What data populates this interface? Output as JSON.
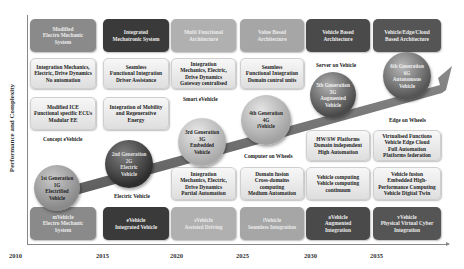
{
  "axes": {
    "y_label": "Performance and Complexity",
    "x_years": [
      "2010",
      "2015",
      "2020",
      "2025",
      "2030",
      "2035"
    ]
  },
  "architecture_boxes": [
    {
      "text": "Modified\nElectro Mechanic\nSystem",
      "color": "#8a8a8a"
    },
    {
      "text": "Integrated\nMechatronic System",
      "color": "#3a3a3a"
    },
    {
      "text": "Multi Functional\nArchitecture",
      "color": "#b0b0b0"
    },
    {
      "text": "Value Based\nArchitecture",
      "color": "#a6a6a6"
    },
    {
      "text": "Vehicle Based\nArchitecture",
      "color": "#4a4a4a"
    },
    {
      "text": "Vehicle/Edge/Cloud\nBased Architecture",
      "color": "#555555"
    }
  ],
  "upper_feature_boxes": [
    {
      "text": "Integration Mechanics,\nElectric, Drive Dynamics\nNo automation"
    },
    {
      "text": "Seamless\nFunctional Integration\nDriver Assistance"
    },
    {
      "text": "Integration\nMechanics, Electric,\nDrive Dynamics\nGateway centralised"
    },
    {
      "text": "Seamless\nFunctional Integration\nDomain control units"
    }
  ],
  "middle_feature_boxes": [
    {
      "text": "Modified ICE\nFunctional specific ECUs\nModular EE"
    },
    {
      "text": "Integration of Mobility\nand Regenerative\nEnergy"
    },
    {
      "text": "HW/SW Platforms\nDomain independent\nHigh Automation"
    },
    {
      "text": "Virtualised Functions\nVehicle Edge Cloud\nFull Automation\nPlatforms federation"
    }
  ],
  "lower_feature_boxes": [
    {
      "text": "Integration\nMechanics, Electric,\nDrive Dynamics\nPartial Automation"
    },
    {
      "text": "Domain fusion\nCross-domains\ncomputing\nMedium Automation"
    },
    {
      "text": "Vehicle computing\nVehicle computing\ncontinuum"
    },
    {
      "text": "Vehicle fusion\nEmbedded High-\nPerformance Computing\nVehicle Digital Twin"
    }
  ],
  "bottom_boxes": [
    {
      "text": "mVehicle\nElectro Mechanic\nSystem",
      "color": "#8a8a8a"
    },
    {
      "text": "eVehicle\nIntegrated Vehicle",
      "color": "#3a3a3a"
    },
    {
      "text": "sVehicle\nAssisted Driving",
      "color": "#b0b0b0"
    },
    {
      "text": "iVehicle\nSeamless Integration",
      "color": "#a6a6a6"
    },
    {
      "text": "aVehicle\nAugmented\nIntegration",
      "color": "#4a4a4a"
    },
    {
      "text": "vVehicle\nPhysical Virtual Cyber\nIntegration",
      "color": "#555555"
    }
  ],
  "stage_labels": {
    "concept": "Concept eVehicle",
    "electric": "Electric Vehicle",
    "smart": "Smart eVehicle",
    "computer": "Computer on Wheels",
    "server": "Server on Vehicle",
    "edge": "Edge on Wheels"
  },
  "generations": [
    {
      "text": "1st Generation\n1G\nElectrified\nVehicle",
      "color": "#8a8a8a"
    },
    {
      "text": "2nd Generation\n2G\nElectric\nVehicle",
      "color": "#3a3a3a"
    },
    {
      "text": "3rd Generation\n3G\nEmbedded\nVehicle",
      "color": "#b0b0b0"
    },
    {
      "text": "4th Generation\n4G\niVehicle",
      "color": "#a6a6a6"
    },
    {
      "text": "5th Generation\n5G\nAugmented\nVehicle",
      "color": "#4a4a4a"
    },
    {
      "text": "6th Generation\n6G\nAutonomous\nVehicle",
      "color": "#555555"
    }
  ],
  "colors": {
    "arrow": "#6e6e6e",
    "axis": "#888888"
  }
}
